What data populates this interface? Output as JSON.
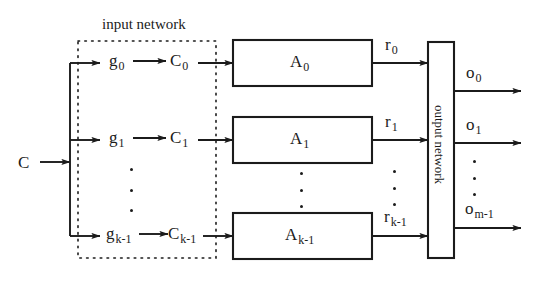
{
  "figure": {
    "type": "block-diagram",
    "title": "",
    "background_color": "#ffffff",
    "stroke_color": "#1b1b1b"
  },
  "groups": {
    "input_network": {
      "label": "input network",
      "border_style": "dotted"
    },
    "output_network": {
      "label": "output network",
      "border_style": "solid",
      "orientation": "vertical"
    }
  },
  "input": {
    "signal": "C"
  },
  "rows": [
    {
      "g": "g",
      "g_sub": "0",
      "c": "C",
      "c_sub": "0",
      "a": "A",
      "a_sub": "0",
      "r": "r",
      "r_sub": "0"
    },
    {
      "g": "g",
      "g_sub": "1",
      "c": "C",
      "c_sub": "1",
      "a": "A",
      "a_sub": "1",
      "r": "r",
      "r_sub": "1"
    },
    {
      "g": "g",
      "g_sub": "k-1",
      "c": "C",
      "c_sub": "k-1",
      "a": "A",
      "a_sub": "k-1",
      "r": "r",
      "r_sub": "k-1"
    }
  ],
  "outputs": [
    {
      "o": "o",
      "o_sub": "0"
    },
    {
      "o": "o",
      "o_sub": "1"
    },
    {
      "o": "o",
      "o_sub": "m-1"
    }
  ],
  "ellipses": {
    "glyph": "vertical-dots",
    "count": 3,
    "locations": [
      "between-g-rows",
      "between-c-rows",
      "between-a-boxes",
      "between-r-labels",
      "between-o-labels"
    ]
  }
}
